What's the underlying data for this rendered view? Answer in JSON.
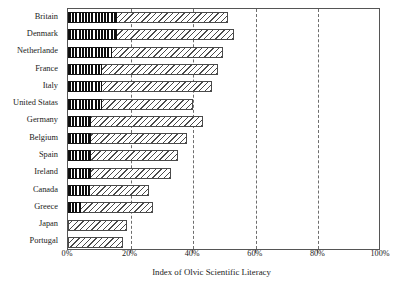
{
  "chart_data": {
    "type": "bar",
    "orientation": "horizontal",
    "title": "",
    "xlabel": "Index of Olvic Scientific Literacy",
    "ylabel": "",
    "xlim": [
      0,
      100
    ],
    "xticks": [
      0,
      20,
      40,
      60,
      80,
      100
    ],
    "xtick_labels": [
      "0%",
      "20%",
      "40%",
      "60%",
      "80%",
      "100%"
    ],
    "grid": "vertical-dashed",
    "legend": "none",
    "categories": [
      "Britain",
      "Denmark",
      "Netherlande",
      "France",
      "Italy",
      "United Statas",
      "Germany",
      "Belgium",
      "Spain",
      "Ireland",
      "Canada",
      "Greece",
      "Japan",
      "Portugal"
    ],
    "series": [
      {
        "name": "inner-dark-segment",
        "pattern": "vertical-stripes",
        "values": [
          15.5,
          15.5,
          14.0,
          11.0,
          11.0,
          11.0,
          7.5,
          7.5,
          7.5,
          7.5,
          7.0,
          4.0,
          0.0,
          0.0
        ]
      },
      {
        "name": "total",
        "pattern": "diagonal-hatch",
        "values": [
          51.0,
          53.0,
          49.5,
          48.0,
          46.0,
          40.0,
          43.0,
          38.0,
          35.0,
          33.0,
          26.0,
          27.0,
          19.0,
          17.5
        ]
      }
    ]
  },
  "axis": {
    "x_title": "Index of Olvic Scientific Literacy"
  },
  "colors": {
    "frame": "#555555",
    "gridline": "#6d6d6d",
    "hatch": "#4a4a4a",
    "solid": "#0d0d0d",
    "background": "#ffffff",
    "text": "#1b1b1b"
  }
}
